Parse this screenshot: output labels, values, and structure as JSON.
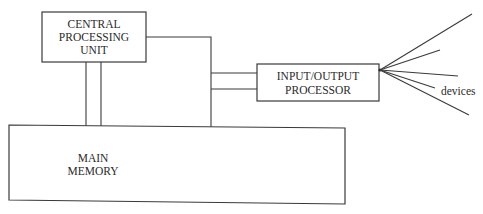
{
  "diagram": {
    "type": "block-diagram",
    "nodes": {
      "cpu": {
        "lines": [
          "CENTRAL",
          "PROCESSING",
          "UNIT"
        ]
      },
      "io": {
        "lines": [
          "INPUT/OUTPUT",
          "PROCESSOR"
        ]
      },
      "memory": {
        "lines": [
          "MAIN",
          "MEMORY"
        ]
      }
    },
    "devices_label": "devices",
    "edges": [
      {
        "from": "cpu",
        "to": "memory",
        "style": "double-line"
      },
      {
        "from": "cpu",
        "to": "memory",
        "style": "single-line",
        "via": "bus"
      },
      {
        "from": "bus",
        "to": "io",
        "style": "double-line"
      },
      {
        "from": "io",
        "to": "devices",
        "style": "fan-out",
        "count": 5
      }
    ],
    "colors": {
      "stroke": "#3a3a3a",
      "background": "#ffffff",
      "text": "#2a2a2a"
    }
  }
}
